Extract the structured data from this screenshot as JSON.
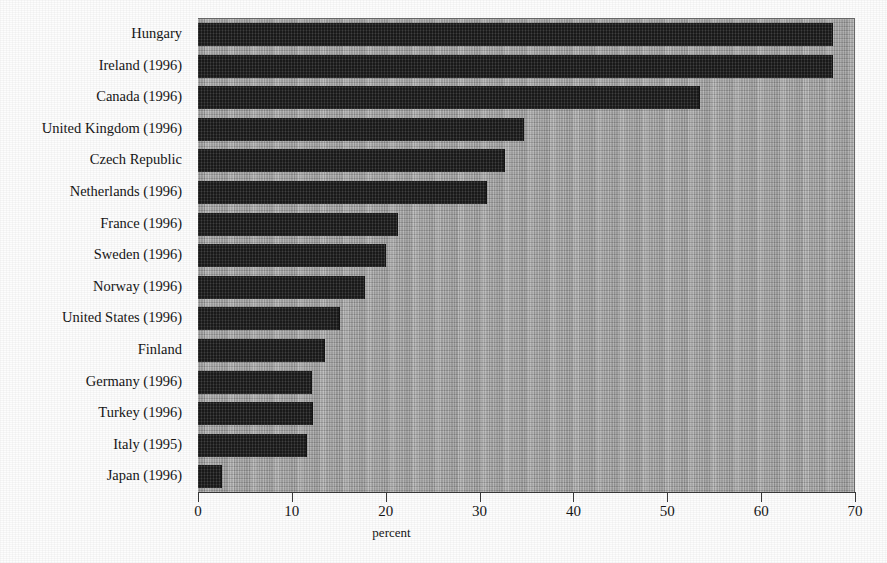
{
  "chart_data": {
    "type": "bar",
    "orientation": "horizontal",
    "title": "",
    "xlabel": "percent",
    "ylabel": "",
    "xlim": [
      0,
      70
    ],
    "xticks": [
      0,
      10,
      20,
      30,
      40,
      50,
      60,
      70
    ],
    "grid": false,
    "legend": null,
    "categories": [
      "Hungary",
      "Ireland (1996)",
      "Canada (1996)",
      "United Kingdom  (1996)",
      "Czech Republic",
      "Netherlands (1996)",
      "France (1996)",
      "Sweden (1996)",
      "Norway (1996)",
      "United States (1996)",
      "Finland",
      "Germany (1996)",
      "Turkey (1996)",
      "Italy (1995)",
      "Japan (1996)"
    ],
    "values": [
      67.7,
      67.7,
      53.5,
      34.7,
      32.7,
      30.8,
      21.3,
      20.0,
      17.8,
      15.1,
      13.5,
      12.1,
      12.3,
      11.6,
      2.6
    ],
    "bar_color": "#2b2b2b",
    "plot_background": "#a9a9a9"
  },
  "axis": {
    "x_label": "percent",
    "tick_labels": [
      "0",
      "10",
      "20",
      "30",
      "40",
      "50",
      "60",
      "70"
    ]
  }
}
